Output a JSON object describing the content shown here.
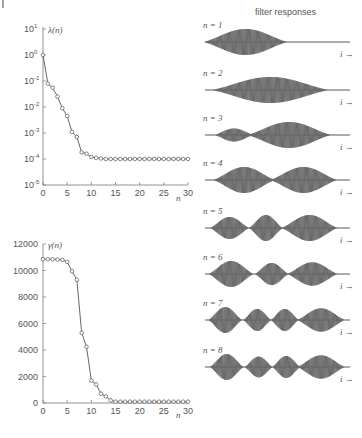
{
  "figure": {
    "filter_title": "filter responses",
    "filter_labels": [
      "n = 1",
      "n = 2",
      "n = 3",
      "n = 4",
      "n = 5",
      "n = 6",
      "n = 7",
      "n = 8"
    ],
    "time_axis_label": "i →"
  },
  "chart_data": [
    {
      "type": "line",
      "title": "",
      "ylabel": "λ(n)",
      "xlabel": "n",
      "yscale": "log",
      "ylim": [
        1e-05,
        10
      ],
      "xlim": [
        0,
        30
      ],
      "xticks": [
        0,
        5,
        10,
        15,
        20,
        25,
        30
      ],
      "yticks": [
        "10^1",
        "10^0",
        "10^-1",
        "10^-2",
        "10^-3",
        "10^-4",
        "10^-5"
      ],
      "marker": "circle",
      "x": [
        0,
        1,
        2,
        3,
        4,
        5,
        6,
        7,
        8,
        9,
        10,
        11,
        12,
        13,
        14,
        15,
        16,
        17,
        18,
        19,
        20,
        21,
        22,
        23,
        24,
        25,
        26,
        27,
        28,
        29,
        30
      ],
      "values": [
        1.0,
        0.08,
        0.055,
        0.025,
        0.009,
        0.0045,
        0.0011,
        0.0007,
        0.00018,
        0.00016,
        0.00012,
        0.00011,
        0.000105,
        0.0001,
        0.0001,
        0.0001,
        0.0001,
        0.0001,
        0.0001,
        0.0001,
        0.0001,
        0.0001,
        0.0001,
        0.0001,
        0.0001,
        0.0001,
        0.0001,
        0.0001,
        0.0001,
        0.0001,
        0.0001
      ]
    },
    {
      "type": "line",
      "title": "",
      "ylabel": "γ(n)",
      "xlabel": "n",
      "ylim": [
        0,
        12000
      ],
      "xlim": [
        0,
        30
      ],
      "xticks": [
        0,
        5,
        10,
        15,
        20,
        25,
        30
      ],
      "yticks": [
        0,
        2000,
        4000,
        6000,
        8000,
        10000,
        12000
      ],
      "marker": "circle",
      "x": [
        0,
        1,
        2,
        3,
        4,
        5,
        6,
        7,
        8,
        9,
        10,
        11,
        12,
        13,
        14,
        15,
        16,
        17,
        18,
        19,
        20,
        21,
        22,
        23,
        24,
        25,
        26,
        27,
        28,
        29,
        30
      ],
      "values": [
        10850,
        10850,
        10850,
        10830,
        10800,
        10650,
        9950,
        9300,
        5300,
        4250,
        1700,
        1400,
        700,
        500,
        200,
        100,
        100,
        100,
        100,
        100,
        100,
        100,
        100,
        100,
        100,
        100,
        100,
        100,
        100,
        100,
        100
      ]
    },
    {
      "type": "line",
      "title": "filter responses",
      "series": [
        {
          "name": "n = 1",
          "lobes": 1,
          "envelope": "single lobe, left-centered"
        },
        {
          "name": "n = 2",
          "lobes": 1,
          "envelope": "single lobe, centered"
        },
        {
          "name": "n = 3",
          "lobes": 2,
          "envelope": "small left lobe, large right lobe"
        },
        {
          "name": "n = 4",
          "lobes": 2,
          "envelope": "two equal lobes"
        },
        {
          "name": "n = 5",
          "lobes": 3,
          "envelope": "three lobes"
        },
        {
          "name": "n = 6",
          "lobes": 3,
          "envelope": "three lobes"
        },
        {
          "name": "n = 7",
          "lobes": 4,
          "envelope": "four lobes"
        },
        {
          "name": "n = 8",
          "lobes": 4,
          "envelope": "four lobes"
        }
      ],
      "xlabel": "i →"
    }
  ]
}
